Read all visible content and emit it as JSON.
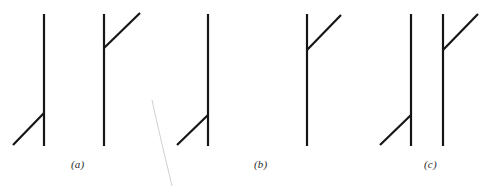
{
  "figure": {
    "width": 488,
    "height": 186,
    "background_color": "#ffffff",
    "stroke_color": "#161616",
    "faint_stroke_color": "#c9c9c9",
    "stroke_width": 2.2,
    "faint_stroke_width": 0.9,
    "type": "line-drawing"
  },
  "panels": [
    {
      "id": "a",
      "label": "(a)",
      "label_x": 71,
      "label_y": 158,
      "shapes": [
        {
          "name": "stem-1",
          "kind": "vertical-line",
          "x1": 44,
          "y1": 14,
          "x2": 44,
          "y2": 146
        },
        {
          "name": "branch-1",
          "kind": "diagonal-line",
          "direction": "down-left",
          "x1": 44,
          "y1": 113,
          "x2": 13,
          "y2": 145
        },
        {
          "name": "stem-2",
          "kind": "vertical-line",
          "x1": 104,
          "y1": 14,
          "x2": 104,
          "y2": 146
        },
        {
          "name": "branch-2",
          "kind": "diagonal-line",
          "direction": "up-right",
          "x1": 104,
          "y1": 48,
          "x2": 140,
          "y2": 13
        },
        {
          "name": "stem-3",
          "kind": "vertical-line",
          "x1": 208,
          "y1": 14,
          "x2": 208,
          "y2": 146
        },
        {
          "name": "branch-3",
          "kind": "diagonal-line",
          "direction": "down-left",
          "x1": 208,
          "y1": 115,
          "x2": 177,
          "y2": 145
        }
      ]
    },
    {
      "id": "b",
      "label": "(b)",
      "label_x": 254,
      "label_y": 158,
      "shapes": [
        {
          "name": "stem-1",
          "kind": "vertical-line",
          "x1": 307,
          "y1": 14,
          "x2": 307,
          "y2": 146
        },
        {
          "name": "branch-1",
          "kind": "diagonal-line",
          "direction": "up-right",
          "x1": 307,
          "y1": 50,
          "x2": 341,
          "y2": 15
        }
      ]
    },
    {
      "id": "c",
      "label": "(c)",
      "label_x": 424,
      "label_y": 158,
      "shapes": [
        {
          "name": "stem-1",
          "kind": "vertical-line",
          "x1": 411,
          "y1": 14,
          "x2": 411,
          "y2": 146
        },
        {
          "name": "branch-1",
          "kind": "diagonal-line",
          "direction": "down-left",
          "x1": 411,
          "y1": 115,
          "x2": 380,
          "y2": 145
        },
        {
          "name": "stem-2",
          "kind": "vertical-line",
          "x1": 443,
          "y1": 14,
          "x2": 443,
          "y2": 146
        },
        {
          "name": "branch-2",
          "kind": "diagonal-line",
          "direction": "up-right",
          "x1": 443,
          "y1": 50,
          "x2": 478,
          "y2": 14
        }
      ]
    }
  ],
  "stray_mark": {
    "name": "faint-curve",
    "kind": "curve",
    "path": "M152,100 C158,128 164,152 172,186",
    "color": "#c9c9c9",
    "width": 0.9
  }
}
